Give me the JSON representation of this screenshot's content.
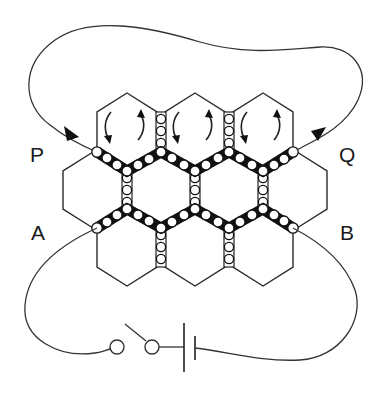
{
  "figure": {
    "labels": {
      "P": "P",
      "Q": "Q",
      "A": "A",
      "B": "B"
    },
    "components": {
      "terminals": [
        "P",
        "Q",
        "A",
        "B"
      ],
      "switch": "open switch",
      "battery": "cell",
      "hex_rows": [
        3,
        4,
        3
      ],
      "rotation_arrows_cells": 3
    },
    "colors": {
      "line": "#2a2a2a",
      "chain": "#111111",
      "background": "#ffffff"
    }
  }
}
